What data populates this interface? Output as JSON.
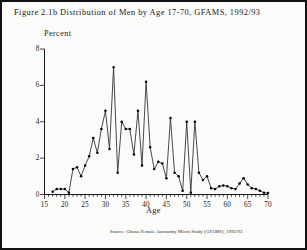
{
  "figure": {
    "title": "Figure 2.1b   Distribution of Men by Age 17-70, GFAMS, 1992/93",
    "source": "Source: Ghana Female Autonomy Micro Study (GFAMS), 1992/93"
  },
  "colors": {
    "ink": "#1a1a1a",
    "line": "#333333",
    "marker": "#000000",
    "background": "#fbfbf9",
    "frame": "#111111"
  },
  "chart_data": {
    "type": "line",
    "title": "Figure 2.1b   Distribution of Men by Age 17-70, GFAMS, 1992/93",
    "xlabel": "Age",
    "ylabel": "Percent",
    "xlim": [
      15,
      70
    ],
    "ylim": [
      0,
      8
    ],
    "xticks": [
      15,
      20,
      25,
      30,
      35,
      40,
      45,
      50,
      55,
      60,
      65,
      70
    ],
    "yticks": [
      0,
      2,
      4,
      6,
      8
    ],
    "grid": false,
    "legend": false,
    "markers": true,
    "x": [
      17,
      18,
      19,
      20,
      21,
      22,
      23,
      24,
      25,
      26,
      27,
      28,
      29,
      30,
      31,
      32,
      33,
      34,
      35,
      36,
      37,
      38,
      39,
      40,
      41,
      42,
      43,
      44,
      45,
      46,
      47,
      48,
      49,
      50,
      51,
      52,
      53,
      54,
      55,
      56,
      57,
      58,
      59,
      60,
      61,
      62,
      63,
      64,
      65,
      66,
      67,
      68,
      69,
      70
    ],
    "values": [
      0.15,
      0.3,
      0.3,
      0.3,
      0.1,
      1.4,
      1.5,
      1.0,
      1.6,
      2.1,
      3.1,
      2.3,
      3.6,
      4.6,
      2.5,
      7.0,
      1.2,
      4.0,
      3.6,
      3.6,
      2.2,
      4.6,
      1.6,
      6.2,
      2.6,
      1.4,
      1.8,
      1.7,
      0.9,
      4.2,
      1.2,
      1.0,
      0.2,
      4.0,
      0.1,
      4.0,
      1.2,
      0.8,
      1.0,
      0.35,
      0.3,
      0.45,
      0.5,
      0.45,
      0.35,
      0.3,
      0.6,
      0.9,
      0.55,
      0.35,
      0.3,
      0.2,
      0.1,
      0.08
    ]
  }
}
